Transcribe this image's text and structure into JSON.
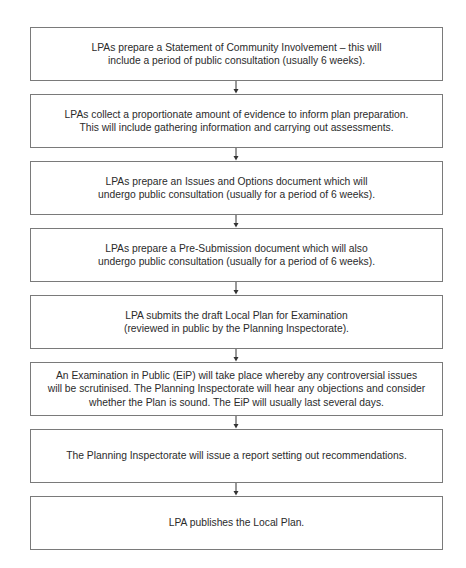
{
  "diagram": {
    "type": "flowchart",
    "direction": "top-to-bottom",
    "steps": [
      {
        "text": "LPAs prepare a Statement of Community Involvement – this will\ninclude a period of public consultation (usually 6 weeks)."
      },
      {
        "text": "LPAs collect a proportionate amount of evidence to inform plan preparation.\nThis will include gathering information and carrying out assessments."
      },
      {
        "text": "LPAs prepare an Issues and Options document which will\nundergo public consultation (usually for a period of 6 weeks)."
      },
      {
        "text": "LPAs prepare a Pre-Submission document which will also\nundergo public consultation (usually for a period of 6 weeks)."
      },
      {
        "text": "LPA submits the draft Local Plan for Examination\n(reviewed in public by the Planning Inspectorate)."
      },
      {
        "text": "An Examination in Public (EiP) will take place whereby any controversial issues\nwill be scrutinised. The Planning Inspectorate will hear any objections and consider\nwhether the Plan is sound. The EiP will usually last several days."
      },
      {
        "text": "The Planning Inspectorate will issue a report setting out recommendations."
      },
      {
        "text": "LPA publishes the Local Plan."
      }
    ],
    "colors": {
      "border": "#7a7a7a",
      "text": "#2b2b2b",
      "arrow": "#333333",
      "background": "#ffffff"
    }
  }
}
